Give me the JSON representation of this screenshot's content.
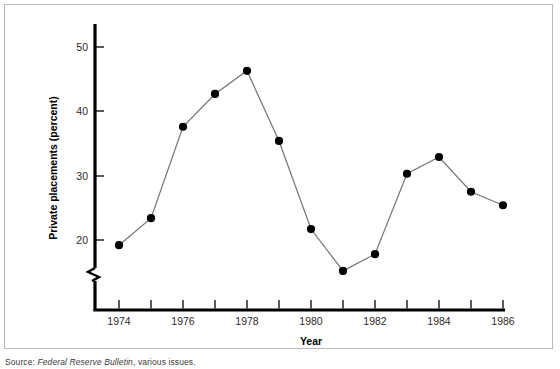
{
  "figure": {
    "source_prefix": "Source:",
    "source_publication": "Federal Reserve Bulletin",
    "source_suffix": ", various issues."
  },
  "chart_data": {
    "type": "line",
    "title": "",
    "xlabel": "Year",
    "ylabel": "Private placements (percent)",
    "x": [
      1974,
      1975,
      1976,
      1977,
      1978,
      1979,
      1980,
      1981,
      1982,
      1983,
      1984,
      1985,
      1986
    ],
    "values": [
      19.2,
      23.4,
      37.6,
      42.7,
      46.3,
      35.4,
      21.7,
      15.2,
      17.8,
      30.3,
      32.9,
      27.5,
      25.4
    ],
    "xlim": [
      1973.4,
      1986.6
    ],
    "ylim": [
      14.0,
      53.5
    ],
    "y_ticks": [
      20,
      30,
      40,
      50
    ],
    "y_tick_labels": [
      "20",
      "30",
      "40",
      "50"
    ],
    "x_ticks": [
      1974,
      1975,
      1976,
      1977,
      1978,
      1979,
      1980,
      1981,
      1982,
      1983,
      1984,
      1985,
      1986
    ],
    "x_tick_labels_shown": [
      "1974",
      "1976",
      "1978",
      "1980",
      "1982",
      "1984",
      "1986"
    ],
    "x_labeled_years": [
      1974,
      1976,
      1978,
      1980,
      1982,
      1984,
      1986
    ],
    "axis_break": true,
    "axis_break_note": "y-axis broken below 20",
    "grid": false,
    "legend": false,
    "marker": "filled-circle",
    "marker_color": "#000000",
    "line_color": "#777777",
    "axis_color": "#000000"
  }
}
